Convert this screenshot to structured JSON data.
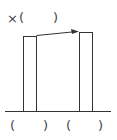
{
  "top_label": {
    "prefix": "×",
    "open": "(",
    "close": ")"
  },
  "bottom_labels": [
    {
      "open": "(",
      "close": ")"
    },
    {
      "open": "(",
      "close": ")"
    }
  ],
  "colors": {
    "stroke": "#333333",
    "background": "#ffffff"
  }
}
